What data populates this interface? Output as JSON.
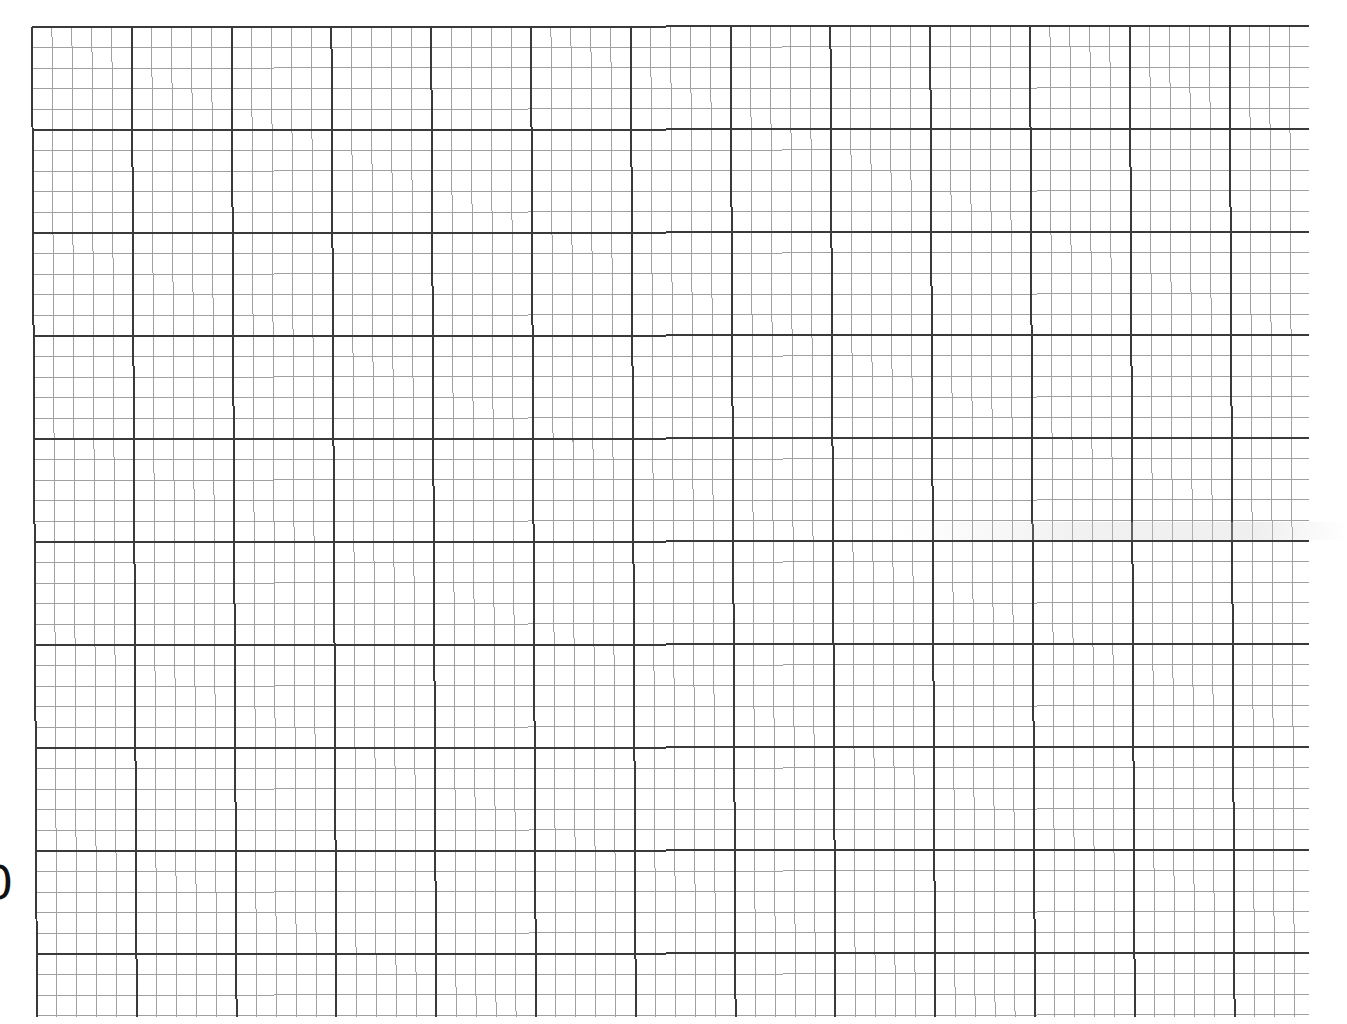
{
  "sheet": {
    "type": "graph-paper",
    "background": "#ffffff",
    "grid": {
      "origin_x": 32,
      "origin_y": 27,
      "major_cell_width": 99.8,
      "major_cell_height": 103.0,
      "minor_divisions_per_major": 5,
      "major_columns": 12,
      "extra_minor_columns_after_last_major": 3,
      "major_rows": 9,
      "extra_minor_rows_after_last_major": 3,
      "horizontal_line_end_x": 1309,
      "vertical_line_end_y": 1017,
      "major_line_color": "#3a3a3a",
      "major_line_width": 2,
      "minor_line_color": "#a0a0a0",
      "minor_line_width": 1
    },
    "edge_glyph": {
      "text": "0",
      "position": "left edge, clipped",
      "approx_y": 883
    }
  }
}
